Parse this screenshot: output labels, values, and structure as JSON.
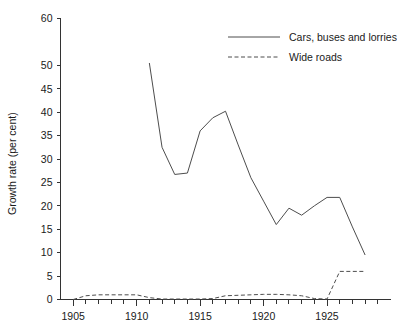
{
  "chart_data": {
    "type": "line",
    "title": "",
    "xlabel": "",
    "ylabel": "Growth rate (per cent)",
    "xlim": [
      1904,
      1930
    ],
    "ylim": [
      0,
      60
    ],
    "ytick_labels": [
      "0",
      "5",
      "10",
      "15",
      "20",
      "25",
      "30",
      "35",
      "40",
      "45",
      "50",
      "60"
    ],
    "ytick_values": [
      0,
      5,
      10,
      15,
      20,
      25,
      30,
      35,
      40,
      45,
      50,
      60
    ],
    "xtick_labels": [
      "1905",
      "1910",
      "1915",
      "1920",
      "1925"
    ],
    "xtick_values": [
      1905,
      1910,
      1915,
      1920,
      1925
    ],
    "grid": false,
    "legend_position": "top-right",
    "series": [
      {
        "name": "Cars, buses and lorries",
        "style": "solid",
        "color": "#4d4d4d",
        "x": [
          1911,
          1912,
          1913,
          1914,
          1915,
          1916,
          1917,
          1918,
          1919,
          1920,
          1921,
          1922,
          1923,
          1924,
          1925,
          1926,
          1927,
          1928
        ],
        "values": [
          50.5,
          32.5,
          26.7,
          27.0,
          36.0,
          38.8,
          40.2,
          33.0,
          26.0,
          21.0,
          16.0,
          19.5,
          18.0,
          20.0,
          21.8,
          21.8,
          15.5,
          9.5
        ]
      },
      {
        "name": "Wide roads",
        "style": "dashed",
        "color": "#4d4d4d",
        "x": [
          1905,
          1906,
          1907,
          1908,
          1909,
          1910,
          1911,
          1912,
          1913,
          1914,
          1915,
          1916,
          1917,
          1918,
          1919,
          1920,
          1921,
          1922,
          1923,
          1924,
          1925,
          1926,
          1927,
          1928
        ],
        "values": [
          0.0,
          0.8,
          1.0,
          1.0,
          1.0,
          1.0,
          0.4,
          0.1,
          0.1,
          0.1,
          0.1,
          0.2,
          0.8,
          0.9,
          1.0,
          1.1,
          1.1,
          1.0,
          0.8,
          0.2,
          0.1,
          6.0,
          6.0,
          6.0
        ]
      }
    ]
  },
  "legend": {
    "entries": [
      {
        "label": "Cars, buses and lorries",
        "style": "solid"
      },
      {
        "label": "Wide roads",
        "style": "dashed"
      }
    ]
  },
  "axes": {
    "y_title": "Growth rate (per cent)"
  }
}
